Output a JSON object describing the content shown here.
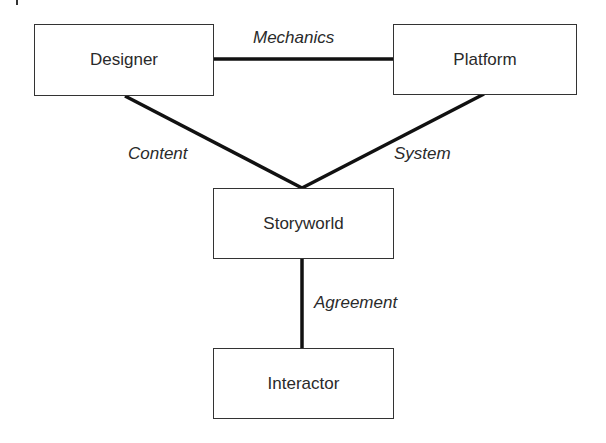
{
  "diagram": {
    "nodes": {
      "designer": {
        "label": "Designer"
      },
      "platform": {
        "label": "Platform"
      },
      "storyworld": {
        "label": "Storyworld"
      },
      "interactor": {
        "label": "Interactor"
      }
    },
    "edges": {
      "designer_platform": {
        "label": "Mechanics"
      },
      "designer_storyworld": {
        "label": "Content"
      },
      "platform_storyworld": {
        "label": "System"
      },
      "storyworld_interactor": {
        "label": "Agreement"
      }
    },
    "colors": {
      "line": "#111111",
      "box_border": "#333333",
      "background": "#ffffff"
    }
  }
}
